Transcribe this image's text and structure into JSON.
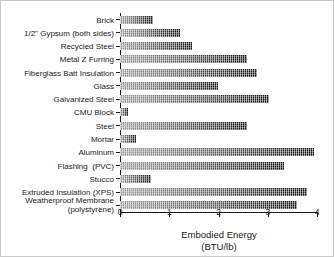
{
  "chart_data": {
    "type": "bar",
    "orientation": "horizontal",
    "title": "",
    "xlabel": "Embodied Energy",
    "xlabel_units": "(BTU/lb)",
    "ylabel": "",
    "xlim": [
      0,
      4
    ],
    "xticks": [
      "0",
      "1",
      "2",
      "3",
      "4"
    ],
    "grid": false,
    "legend": false,
    "categories": [
      "Brick",
      "1/2\" Gypsum (both sides)",
      "Recycled Steel",
      "Metal Z Furring",
      "Fiberglass Batt Insulation",
      "Glass",
      "Galvanized Steel",
      "CMU Block",
      "Steel",
      "Mortar",
      "Aluminum",
      "Flashing  (PVC)",
      "Stucco",
      "Extruded Insulation (XPS)",
      "Weatherproof Membrane\n(polystyrene)"
    ],
    "values": [
      0.67,
      1.21,
      1.46,
      2.58,
      2.79,
      1.99,
      3.02,
      0.16,
      2.57,
      0.33,
      3.93,
      3.32,
      0.62,
      3.79,
      3.59
    ],
    "colors": {
      "bar_light": "#9a9a9a",
      "bar_dark": "#111111",
      "axis": "#1a1a1a",
      "background": "#ffffff",
      "frame_border": "#c9c9c9"
    }
  }
}
